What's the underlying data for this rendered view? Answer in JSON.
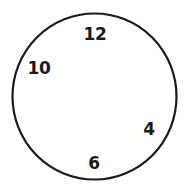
{
  "figure": {
    "kind": "clock-face-diagram",
    "background_color": "#ffffff",
    "stroke_color": "#1a1a1a",
    "text_color": "#1a1a1a",
    "dial": {
      "shape": "circle",
      "center_x": 94.5,
      "center_y": 96.5,
      "radius_x": 82,
      "radius_y": 83,
      "stroke_width": 2.2,
      "fill": "none"
    },
    "hour_labels": [
      {
        "text": "12",
        "x": 95,
        "y": 34,
        "clock_position": "top"
      },
      {
        "text": "10",
        "x": 39,
        "y": 68,
        "clock_position": "upper-left"
      },
      {
        "text": "4",
        "x": 149,
        "y": 129,
        "clock_position": "lower-right"
      },
      {
        "text": "6",
        "x": 94,
        "y": 163,
        "clock_position": "bottom"
      }
    ]
  }
}
